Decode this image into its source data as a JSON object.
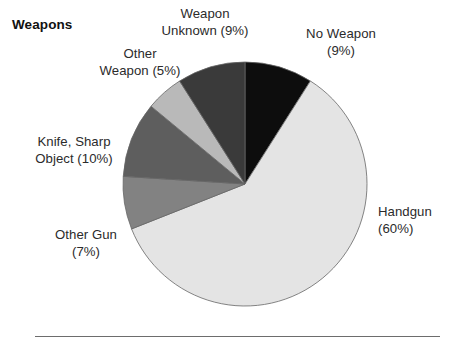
{
  "chart_title": "Weapons",
  "footer": {
    "rule": "horizontal-rule"
  },
  "labels": {
    "no_weapon": "No Weapon\n(9%)",
    "weapon_unknown": "Weapon\nUnknown (9%)",
    "other_weapon": "Other\nWeapon (5%)",
    "knife_sharp_object": "Knife, Sharp\nObject (10%)",
    "other_gun": "Other Gun\n(7%)",
    "handgun": "Handgun\n(60%)"
  },
  "chart_data": {
    "type": "pie",
    "title": "Weapons",
    "xlabel": "",
    "ylabel": "",
    "start_angle_deg": 0,
    "direction": "clockwise",
    "legend": "none",
    "grid": false,
    "center": {
      "x": 245,
      "y": 184
    },
    "radius": 122,
    "outline_color": "#666666",
    "categories": [
      "No Weapon",
      "Handgun",
      "Other Gun",
      "Knife, Sharp Object",
      "Other Weapon",
      "Weapon Unknown"
    ],
    "values": [
      9,
      60,
      7,
      10,
      5,
      9
    ],
    "unit": "percent",
    "slices": [
      {
        "name": "No Weapon",
        "value": 9,
        "label": "No Weapon (9%)",
        "color": "#0d0d0d"
      },
      {
        "name": "Handgun",
        "value": 60,
        "label": "Handgun (60%)",
        "color": "#e4e4e4"
      },
      {
        "name": "Other Gun",
        "value": 7,
        "label": "Other Gun (7%)",
        "color": "#828282"
      },
      {
        "name": "Knife, Sharp Object",
        "value": 10,
        "label": "Knife, Sharp Object (10%)",
        "color": "#5e5e5e"
      },
      {
        "name": "Other Weapon",
        "value": 5,
        "label": "Other Weapon (5%)",
        "color": "#b9b9b9"
      },
      {
        "name": "Weapon Unknown",
        "value": 9,
        "label": "Weapon Unknown (9%)",
        "color": "#3a3a3a"
      }
    ]
  }
}
